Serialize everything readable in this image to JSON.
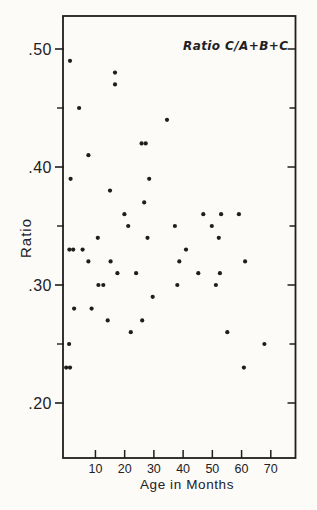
{
  "figure": {
    "kind": "scanned scatter plot figure",
    "background_color": "#fcfbf8",
    "ink_color": "#1f1e1c"
  },
  "chart_data": {
    "type": "scatter",
    "title": "Ratio C/A+B+C",
    "xlabel": "Age in Months",
    "ylabel": "Ratio",
    "xlim": [
      0,
      78
    ],
    "ylim": [
      0.155,
      0.53
    ],
    "grid": false,
    "legend": "none",
    "marker": "filled-dot",
    "x_axis": {
      "ticks": [
        {
          "value": 10,
          "label": "10"
        },
        {
          "value": 20,
          "label": "20"
        },
        {
          "value": 30,
          "label": "30"
        },
        {
          "value": 40,
          "label": "40"
        },
        {
          "value": 50,
          "label": "50"
        },
        {
          "value": 60,
          "label": "60"
        },
        {
          "value": 70,
          "label": "70"
        }
      ]
    },
    "y_axis": {
      "major_ticks": [
        {
          "value": 0.5,
          "label": ".50"
        },
        {
          "value": 0.4,
          "label": ".40"
        },
        {
          "value": 0.3,
          "label": ".30"
        },
        {
          "value": 0.2,
          "label": ".20"
        }
      ],
      "minor_ticks": [
        0.45,
        0.35,
        0.25
      ],
      "right_border_ticks": [
        0.5,
        0.45,
        0.4,
        0.35,
        0.3,
        0.25,
        0.2
      ]
    },
    "points_format": "[age_months, ratio]",
    "points": [
      [
        1.3,
        0.49
      ],
      [
        16.7,
        0.48
      ],
      [
        16.7,
        0.47
      ],
      [
        4.4,
        0.45
      ],
      [
        34.5,
        0.44
      ],
      [
        25.8,
        0.42
      ],
      [
        27.2,
        0.42
      ],
      [
        7.6,
        0.41
      ],
      [
        1.5,
        0.39
      ],
      [
        28.4,
        0.39
      ],
      [
        15.0,
        0.38
      ],
      [
        26.7,
        0.37
      ],
      [
        19.9,
        0.36
      ],
      [
        46.9,
        0.36
      ],
      [
        53.0,
        0.36
      ],
      [
        59.1,
        0.36
      ],
      [
        21.2,
        0.35
      ],
      [
        37.2,
        0.35
      ],
      [
        49.8,
        0.35
      ],
      [
        10.8,
        0.34
      ],
      [
        27.8,
        0.34
      ],
      [
        52.2,
        0.34
      ],
      [
        1.1,
        0.33
      ],
      [
        2.4,
        0.33
      ],
      [
        5.6,
        0.33
      ],
      [
        41.0,
        0.33
      ],
      [
        7.6,
        0.32
      ],
      [
        15.2,
        0.32
      ],
      [
        38.7,
        0.32
      ],
      [
        61.2,
        0.32
      ],
      [
        17.5,
        0.31
      ],
      [
        23.9,
        0.31
      ],
      [
        45.2,
        0.31
      ],
      [
        52.6,
        0.31
      ],
      [
        11.0,
        0.3
      ],
      [
        12.7,
        0.3
      ],
      [
        38.0,
        0.3
      ],
      [
        51.2,
        0.3
      ],
      [
        29.6,
        0.29
      ],
      [
        2.7,
        0.28
      ],
      [
        8.7,
        0.28
      ],
      [
        14.2,
        0.27
      ],
      [
        26.0,
        0.27
      ],
      [
        22.1,
        0.26
      ],
      [
        55.1,
        0.26
      ],
      [
        1.0,
        0.25
      ],
      [
        67.8,
        0.25
      ],
      [
        60.8,
        0.23
      ],
      [
        0.0,
        0.23
      ],
      [
        1.3,
        0.23
      ]
    ]
  }
}
